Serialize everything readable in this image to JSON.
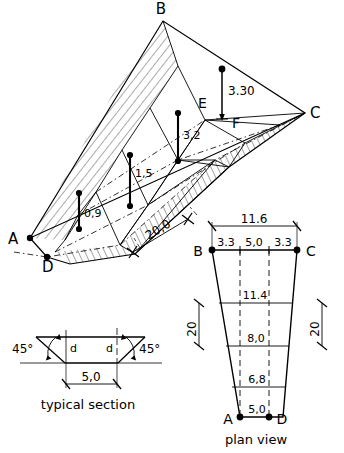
{
  "drawing": {
    "title": "Tapered excavation - pictorial, typical section and plan view",
    "line_color": "#000000",
    "background": "#ffffff"
  },
  "pictorial": {
    "vertices": {
      "B": "B",
      "C": "C",
      "A": "A",
      "D": "D",
      "E": "E",
      "F": "F"
    },
    "depths": [
      {
        "id": "depth-0-9",
        "label": "0,9"
      },
      {
        "id": "depth-1-5",
        "label": "1,5"
      },
      {
        "id": "depth-3-2",
        "label": "3,2"
      },
      {
        "id": "depth-3-30",
        "label": "3.30"
      }
    ],
    "length_dimension": "20,0"
  },
  "typical_section": {
    "caption": "typical  section",
    "angle_left": "45°",
    "angle_right": "45°",
    "depth_left": "d",
    "depth_right": "d",
    "base_width": "5,0"
  },
  "plan_view": {
    "caption": "plan  view",
    "corners": {
      "B": "B",
      "C": "C",
      "A": "A",
      "D": "D"
    },
    "top_overall": "11.6",
    "top_left_offset": "3.3",
    "top_middle": "5,0",
    "top_right_offset": "3.3",
    "widths": [
      "11.4",
      "8,0",
      "6,8"
    ],
    "bottom_width": "5,0",
    "side_dimension_left": "20",
    "side_dimension_right": "20"
  }
}
